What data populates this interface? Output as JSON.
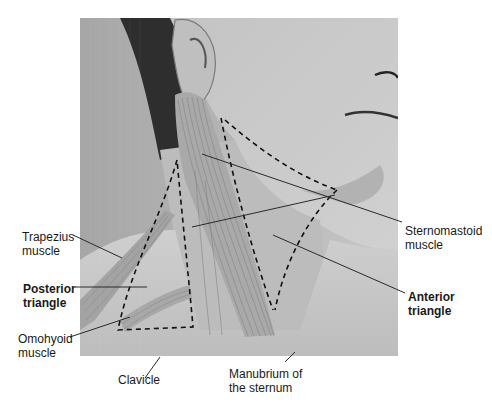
{
  "figure": {
    "photo": {
      "x": 80,
      "y": 18,
      "width": 318,
      "height": 338,
      "tone": "#a9a9a9"
    },
    "colors": {
      "background": "#ffffff",
      "text": "#1a1a1a",
      "leader_line": "#2a2a2a",
      "dashed_outline": "#111111",
      "muscle_fibers": "#8a8a8a"
    }
  },
  "labels": {
    "trapezius": {
      "line1": "Trapezius",
      "line2": "muscle",
      "bold": false
    },
    "posterior": {
      "line1": "Posterior",
      "line2": "triangle",
      "bold": true
    },
    "omohyoid": {
      "line1": "Omohyoid",
      "line2": "muscle",
      "bold": false
    },
    "clavicle": {
      "line1": "Clavicle",
      "bold": false
    },
    "manubrium": {
      "line1": "Manubrium of",
      "line2": "the sternum",
      "bold": false
    },
    "sternomastoid": {
      "line1": "Sternomastoid",
      "line2": "muscle",
      "bold": false
    },
    "anterior": {
      "line1": "Anterior",
      "line2": "triangle",
      "bold": true
    }
  }
}
